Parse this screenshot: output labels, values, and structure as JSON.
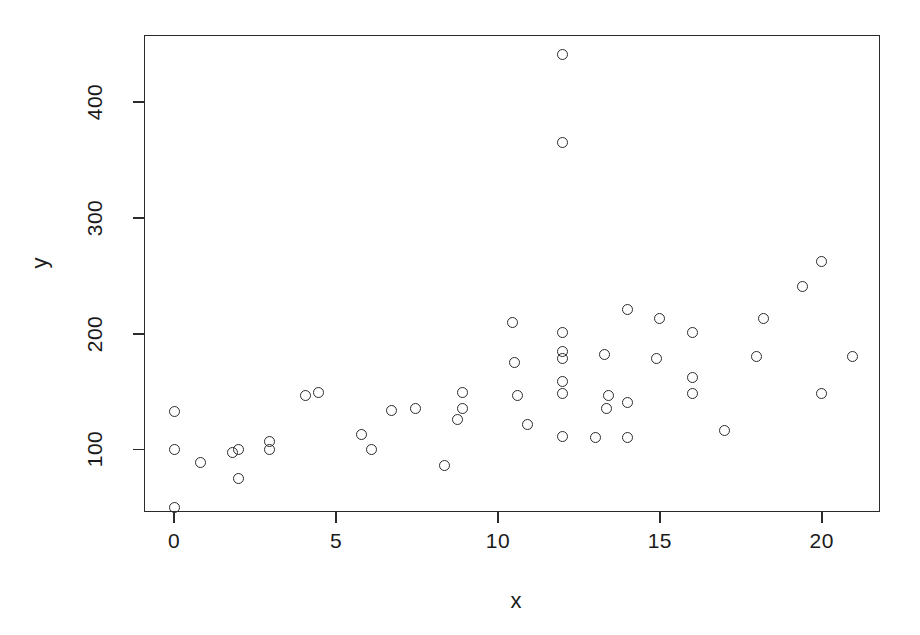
{
  "chart_data": {
    "type": "scatter",
    "title": "",
    "xlabel": "x",
    "ylabel": "y",
    "grid": false,
    "legend": null,
    "xlim": [
      -0.93,
      21.8
    ],
    "ylim": [
      46,
      458
    ],
    "xticks": [
      0,
      5,
      10,
      15,
      20
    ],
    "xticklabels": [
      "0",
      "5",
      "10",
      "15",
      "20"
    ],
    "yticks": [
      100,
      200,
      300,
      400
    ],
    "yticklabels": [
      "100",
      "200",
      "300",
      "400"
    ],
    "marker": "open-circle",
    "marker_color": "#2b2b2b",
    "points": [
      {
        "x": 0.0,
        "y": 133
      },
      {
        "x": 0.0,
        "y": 100
      },
      {
        "x": 0.0,
        "y": 50
      },
      {
        "x": 0.8,
        "y": 89
      },
      {
        "x": 1.8,
        "y": 97
      },
      {
        "x": 2.0,
        "y": 100
      },
      {
        "x": 2.0,
        "y": 75
      },
      {
        "x": 2.95,
        "y": 107
      },
      {
        "x": 2.95,
        "y": 100
      },
      {
        "x": 4.05,
        "y": 147
      },
      {
        "x": 4.45,
        "y": 149
      },
      {
        "x": 5.8,
        "y": 113
      },
      {
        "x": 6.1,
        "y": 100
      },
      {
        "x": 6.7,
        "y": 134
      },
      {
        "x": 7.45,
        "y": 135
      },
      {
        "x": 8.35,
        "y": 86
      },
      {
        "x": 8.9,
        "y": 149
      },
      {
        "x": 8.9,
        "y": 135
      },
      {
        "x": 8.75,
        "y": 126
      },
      {
        "x": 10.45,
        "y": 210
      },
      {
        "x": 10.5,
        "y": 175
      },
      {
        "x": 10.6,
        "y": 147
      },
      {
        "x": 10.9,
        "y": 122
      },
      {
        "x": 12.0,
        "y": 441
      },
      {
        "x": 12.0,
        "y": 365
      },
      {
        "x": 12.0,
        "y": 201
      },
      {
        "x": 12.0,
        "y": 185
      },
      {
        "x": 12.0,
        "y": 179
      },
      {
        "x": 12.0,
        "y": 159
      },
      {
        "x": 12.0,
        "y": 148
      },
      {
        "x": 12.0,
        "y": 111
      },
      {
        "x": 13.3,
        "y": 182
      },
      {
        "x": 13.4,
        "y": 147
      },
      {
        "x": 13.35,
        "y": 135
      },
      {
        "x": 13.0,
        "y": 110
      },
      {
        "x": 14.0,
        "y": 221
      },
      {
        "x": 14.0,
        "y": 141
      },
      {
        "x": 14.0,
        "y": 110
      },
      {
        "x": 15.0,
        "y": 213
      },
      {
        "x": 14.9,
        "y": 179
      },
      {
        "x": 16.0,
        "y": 201
      },
      {
        "x": 16.0,
        "y": 162
      },
      {
        "x": 16.0,
        "y": 148
      },
      {
        "x": 17.0,
        "y": 116
      },
      {
        "x": 18.2,
        "y": 213
      },
      {
        "x": 18.0,
        "y": 180
      },
      {
        "x": 19.4,
        "y": 241
      },
      {
        "x": 20.0,
        "y": 262
      },
      {
        "x": 20.0,
        "y": 148
      },
      {
        "x": 20.95,
        "y": 180
      }
    ]
  }
}
